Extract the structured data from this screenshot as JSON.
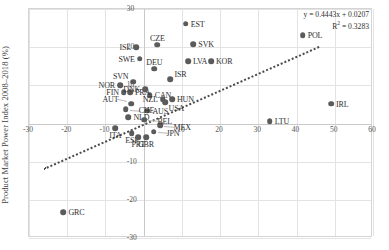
{
  "chart_data": {
    "type": "scatter",
    "title": "",
    "xlabel": "",
    "ylabel": "Product Market Power Index 2008–2018 (%)",
    "xlim": [
      -30,
      60
    ],
    "ylim": [
      -30,
      30
    ],
    "xticks": [
      -30,
      -20,
      -10,
      0,
      10,
      20,
      30,
      40,
      50,
      60
    ],
    "yticks": [
      -30,
      -20,
      -10,
      0,
      10,
      20,
      30
    ],
    "grid": true,
    "legend": false,
    "marker_color": "#5b5b5b",
    "trendline": {
      "equation": "y = 0.4443x + 0.0207",
      "r2_label": "R² = 0.3283",
      "slope": 0.4443,
      "intercept": 0.0207,
      "r2": 0.3283,
      "style": "dotted",
      "color": "#4a4a4a"
    },
    "points": [
      {
        "label": "GRC",
        "x": -21.0,
        "y": -23.2,
        "lpos": "right"
      },
      {
        "label": "ITA",
        "x": -7.4,
        "y": -1.3,
        "lpos": "below"
      },
      {
        "label": "ESP",
        "x": -3.1,
        "y": -2.6,
        "lpos": "below"
      },
      {
        "label": "PRT",
        "x": -1.4,
        "y": -3.6,
        "lpos": "below"
      },
      {
        "label": "GBR",
        "x": 0.6,
        "y": -3.6,
        "lpos": "below"
      },
      {
        "label": "JPN",
        "x": 2.6,
        "y": -2.1,
        "lpos": "leader-right"
      },
      {
        "label": "MEX",
        "x": 4.4,
        "y": -0.4,
        "lpos": "leader-right"
      },
      {
        "label": "NLD",
        "x": -4.0,
        "y": 1.6,
        "lpos": "right"
      },
      {
        "label": "BEL",
        "x": 0.2,
        "y": 1.0,
        "lpos": "leader-right"
      },
      {
        "label": "AUS",
        "x": 1.0,
        "y": 3.4,
        "lpos": "right"
      },
      {
        "label": "CHE",
        "x": -4.7,
        "y": 3.8,
        "lpos": "leader-right"
      },
      {
        "label": "AUT",
        "x": -3.2,
        "y": 5.2,
        "lpos": "leader-left"
      },
      {
        "label": "CAN",
        "x": 1.6,
        "y": 7.4,
        "lpos": "right"
      },
      {
        "label": "FRA",
        "x": -3.6,
        "y": 8.2,
        "lpos": "right"
      },
      {
        "label": "FIN",
        "x": -5.2,
        "y": 8.2,
        "lpos": "left"
      },
      {
        "label": "DNK",
        "x": 0.4,
        "y": 9.0,
        "lpos": "left"
      },
      {
        "label": "NOR",
        "x": -6.2,
        "y": 10.0,
        "lpos": "left"
      },
      {
        "label": "SVN",
        "x": -2.8,
        "y": 11.0,
        "lpos": "leftup"
      },
      {
        "label": "USA",
        "x": 5.6,
        "y": 5.6,
        "lpos": "rightdown"
      },
      {
        "label": "NZL",
        "x": 5.0,
        "y": 6.4,
        "lpos": "left"
      },
      {
        "label": "HUN",
        "x": 7.4,
        "y": 6.4,
        "lpos": "right"
      },
      {
        "label": "ISR",
        "x": 7.0,
        "y": 11.6,
        "lpos": "rightup"
      },
      {
        "label": "DEU",
        "x": 2.8,
        "y": 14.4,
        "lpos": "above"
      },
      {
        "label": "SWE",
        "x": -1.0,
        "y": 17.0,
        "lpos": "left"
      },
      {
        "label": "LVA",
        "x": 11.6,
        "y": 16.4,
        "lpos": "right"
      },
      {
        "label": "KOR",
        "x": 17.6,
        "y": 16.4,
        "lpos": "right"
      },
      {
        "label": "ISL",
        "x": -2.0,
        "y": 20.0,
        "lpos": "left"
      },
      {
        "label": "CZE",
        "x": 3.6,
        "y": 20.6,
        "lpos": "above"
      },
      {
        "label": "SVK",
        "x": 13.0,
        "y": 20.8,
        "lpos": "right"
      },
      {
        "label": "EST",
        "x": 11.0,
        "y": 26.2,
        "lpos": "right"
      },
      {
        "label": "POL",
        "x": 41.6,
        "y": 23.2,
        "lpos": "right"
      },
      {
        "label": "IRL",
        "x": 49.0,
        "y": 5.2,
        "lpos": "right"
      },
      {
        "label": "LTU",
        "x": 33.0,
        "y": 0.6,
        "lpos": "right"
      }
    ]
  }
}
